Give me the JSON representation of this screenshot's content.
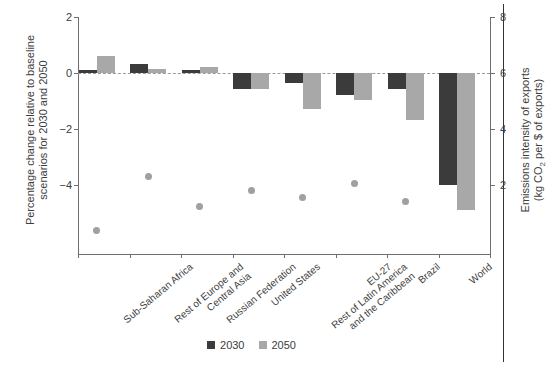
{
  "chart_data": {
    "type": "bar",
    "title": "",
    "categories": [
      "Sub-Saharan Africa",
      "Rest of Europe and Central Asia",
      "Russian Federation",
      "United States",
      "Rest of Latin America and the Caribbean",
      "EU-27",
      "Brazil",
      "World"
    ],
    "category_lines": [
      [
        "Sub-Saharan Africa"
      ],
      [
        "Rest of Europe and",
        "Central Asia"
      ],
      [
        "Russian Federation"
      ],
      [
        "United States"
      ],
      [
        "Rest of Latin America",
        "and the Caribbean"
      ],
      [
        "EU-27"
      ],
      [
        "Brazil"
      ],
      [
        "World"
      ]
    ],
    "series": [
      {
        "name": "2030",
        "color": "#3b3b3b",
        "values": [
          0.13,
          0.33,
          0.11,
          -0.55,
          -0.35,
          -0.75,
          -0.55,
          -3.95
        ]
      },
      {
        "name": "2050",
        "color": "#a8a8a8",
        "values": [
          0.62,
          0.17,
          0.22,
          -0.55,
          -1.25,
          -0.95,
          -1.65,
          -4.85
        ]
      }
    ],
    "points": {
      "name": "Emissions intensity of exports",
      "color": "#a0a0a0",
      "values": [
        0.45,
        2.35,
        1.3,
        1.85,
        1.6,
        2.1,
        1.45,
        null
      ]
    },
    "ylabel": "Percentage change relative to baseline scenarios for 2030 and 2050",
    "ylabel_lines": [
      "Percentage change relative to baseline",
      "scenarios for 2030 and 2050"
    ],
    "y2label": "Emissions intensity of exports (kg CO2 per $ of exports)",
    "y2label_lines": [
      "Emissions intensity of exports",
      "(kg CO2 per $ of exports)"
    ],
    "xlabel": "",
    "ylim": [
      -6.4,
      2.0
    ],
    "yticks": [
      2,
      0,
      -2,
      -4
    ],
    "ytick_labels": [
      "2",
      "0",
      "−2",
      "−4"
    ],
    "y2lim": [
      -0.4,
      8.0
    ],
    "y2ticks": [
      8,
      6,
      4,
      2
    ],
    "y2tick_labels": [
      "8",
      "6",
      "4",
      "2"
    ],
    "grid": false,
    "legend_position": "bottom",
    "legend": [
      {
        "label": "2030",
        "color": "#3b3b3b"
      },
      {
        "label": "2050",
        "color": "#a8a8a8"
      }
    ]
  },
  "axis": {
    "y_left_tick_0": "2",
    "y_left_tick_1": "0",
    "y_left_tick_2": "−2",
    "y_left_tick_3": "−4",
    "y_right_tick_0": "8",
    "y_right_tick_1": "6",
    "y_right_tick_2": "4",
    "y_right_tick_3": "2",
    "left_title_line1": "Percentage change relative to baseline",
    "left_title_line2": "scenarios for 2030 and 2050",
    "right_title_line1": "Emissions intensity of exports",
    "right_title_line2_pre": "(kg CO",
    "right_title_line2_sub": "2",
    "right_title_line2_post": " per $ of exports)"
  }
}
